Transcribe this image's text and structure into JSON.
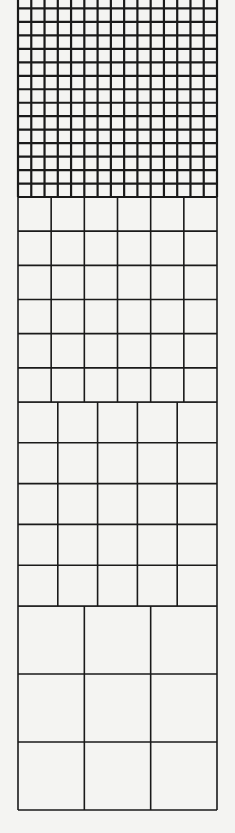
{
  "diagram": {
    "title": "",
    "line_color": "#1a1a1a",
    "background": "#f4f4f2",
    "frame": {
      "left": 18,
      "right": 217
    },
    "sections": [
      {
        "name": "grid-15x15",
        "columns": 15,
        "rows": 15,
        "top": -5,
        "bottom": 197,
        "clipped_top": true,
        "stroke": 2.2
      },
      {
        "name": "grid-6x6",
        "columns": 6,
        "rows": 6,
        "top": 197,
        "bottom": 402,
        "clipped_top": false,
        "stroke": 1.6
      },
      {
        "name": "grid-5x5",
        "columns": 5,
        "rows": 5,
        "top": 402,
        "bottom": 606,
        "clipped_top": false,
        "stroke": 1.6
      },
      {
        "name": "grid-3x3",
        "columns": 3,
        "rows": 3,
        "top": 606,
        "bottom": 810,
        "clipped_top": false,
        "stroke": 1.6
      }
    ]
  }
}
